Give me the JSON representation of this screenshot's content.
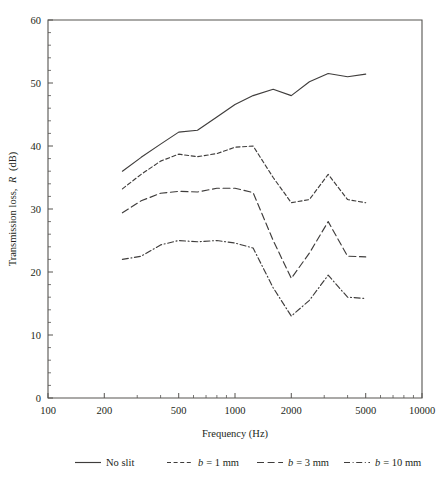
{
  "chart_data": {
    "type": "line",
    "title": "",
    "xlabel": "Frequency (Hz)",
    "ylabel": "Transmission loss, R (dB)",
    "ylabel_plain": "Transmission loss,",
    "ylabel_italic": "R",
    "ylabel_unit": "(dB)",
    "xscale": "log",
    "xlim": [
      100,
      10000
    ],
    "ylim": [
      0,
      60
    ],
    "grid": false,
    "legend_position": "below-axes",
    "x_tick_labels": [
      "100",
      "200",
      "500",
      "1000",
      "2000",
      "5000",
      "10000"
    ],
    "x_tick_values": [
      100,
      200,
      500,
      1000,
      2000,
      5000,
      10000
    ],
    "y_tick_labels": [
      "0",
      "10",
      "20",
      "30",
      "40",
      "50",
      "60"
    ],
    "y_tick_values": [
      0,
      10,
      20,
      30,
      40,
      50,
      60
    ],
    "y_minor_step": 2,
    "x": [
      250,
      315,
      400,
      500,
      630,
      800,
      1000,
      1250,
      1600,
      2000,
      2500,
      3150,
      4000,
      5000
    ],
    "series": [
      {
        "name": "No slit",
        "style": "solid",
        "color": "#3f3d3c",
        "values": [
          36.0,
          38.2,
          40.3,
          42.2,
          42.5,
          44.6,
          46.6,
          48.0,
          49.0,
          48.0,
          50.2,
          51.5,
          51.0,
          51.4
        ]
      },
      {
        "name": "b = 1 mm",
        "style": "dashed",
        "color": "#3f3d3c",
        "values": [
          33.2,
          35.5,
          37.6,
          38.7,
          38.3,
          38.8,
          39.8,
          40.0,
          35.0,
          31.0,
          31.5,
          35.5,
          31.5,
          31.0
        ]
      },
      {
        "name": "b = 3 mm",
        "style": "longdash",
        "color": "#3f3d3c",
        "values": [
          29.4,
          31.3,
          32.5,
          32.8,
          32.7,
          33.3,
          33.3,
          32.6,
          25.0,
          19.0,
          23.0,
          28.0,
          22.5,
          22.4
        ]
      },
      {
        "name": "b = 10 mm",
        "style": "dashdot",
        "color": "#3f3d3c",
        "values": [
          22.0,
          22.5,
          24.3,
          25.0,
          24.8,
          25.0,
          24.6,
          23.8,
          17.5,
          13.0,
          15.5,
          19.5,
          16.0,
          15.8
        ]
      }
    ],
    "legend": [
      {
        "label_plain": "No slit",
        "label_italic": "",
        "style": "solid"
      },
      {
        "label_plain": "= 1 mm",
        "label_italic": "b",
        "style": "dashed"
      },
      {
        "label_plain": "= 3 mm",
        "label_italic": "b",
        "style": "longdash"
      },
      {
        "label_plain": "= 10 mm",
        "label_italic": "b",
        "style": "dashdot"
      }
    ]
  }
}
